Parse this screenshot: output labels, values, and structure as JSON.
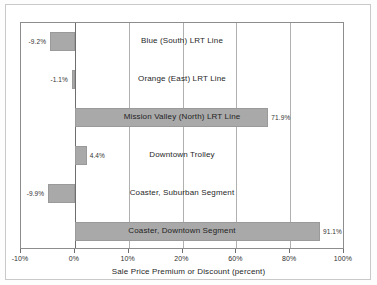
{
  "chart_data": {
    "type": "bar",
    "orientation": "horizontal",
    "title": "",
    "xlabel": "Sale Price Premium or Discount (percent)",
    "ylabel": "",
    "xlim": [
      -10,
      100
    ],
    "grid": true,
    "legend": "none",
    "categories": [
      "Blue (South) LRT Line",
      "Orange (East) LRT Line",
      "Mission Valley (North) LRT Line",
      "Downtown Trolley",
      "Coaster, Suburban Segment",
      "Coaster, Downtown Segment"
    ],
    "values": [
      -9.2,
      -1.1,
      71.9,
      4.4,
      -9.9,
      91.1
    ],
    "value_labels": [
      "-9.2%",
      "-1.1%",
      "71.9%",
      "4.4%",
      "-9.9%",
      "91.1%"
    ],
    "xticks": [
      -10,
      0,
      10,
      20,
      60,
      80,
      100
    ],
    "xtick_labels": [
      "-10%",
      "0%",
      "10%",
      "20%",
      "60%",
      "80%",
      "100%"
    ],
    "bar_color": "#a9a9a9",
    "grid_color": "#b0b0b0",
    "axis_color": "#6e6e6e"
  }
}
